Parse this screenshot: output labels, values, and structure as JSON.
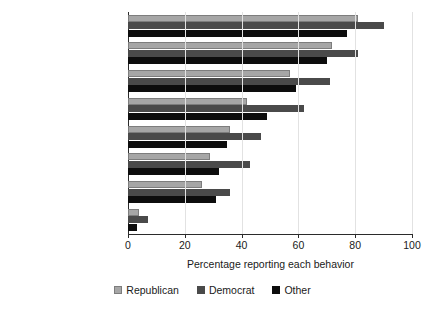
{
  "chart_data": {
    "type": "bar",
    "orientation": "horizontal",
    "title": "",
    "xlabel": "Percentage reporting each behavior",
    "ylabel": "",
    "xlim": [
      0,
      100
    ],
    "xticks": [
      0,
      20,
      40,
      60,
      80,
      100
    ],
    "grid": true,
    "legend_position": "bottom",
    "categories": [
      "Washed hands more",
      "Avoided gatherings",
      "Avoided contact w/ others",
      "Sought info on COVID19",
      "Bought sanitizer",
      "Self-quarantined",
      "Changed travel plans",
      "Visited the doctor"
    ],
    "series": [
      {
        "name": "Republican",
        "color": "#a6a6a6",
        "values": [
          81,
          72,
          57,
          42,
          36,
          29,
          26,
          4
        ]
      },
      {
        "name": "Democrat",
        "color": "#4a4a4a",
        "values": [
          90,
          81,
          71,
          62,
          47,
          43,
          36,
          7
        ]
      },
      {
        "name": "Other",
        "color": "#0d0d0d",
        "values": [
          77,
          70,
          59,
          49,
          35,
          32,
          31,
          3
        ]
      }
    ]
  },
  "axis": {
    "x_title": "Percentage reporting each behavior",
    "tick_labels": [
      "0",
      "20",
      "40",
      "60",
      "80",
      "100"
    ]
  },
  "legend": {
    "items": [
      {
        "label": "Republican",
        "swatch": "legend-swatch-republican"
      },
      {
        "label": "Democrat",
        "swatch": "legend-swatch-democrat"
      },
      {
        "label": "Other",
        "swatch": "legend-swatch-other"
      }
    ]
  }
}
